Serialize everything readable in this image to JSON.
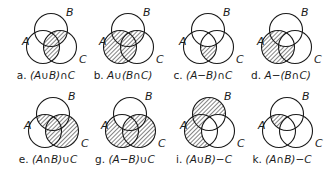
{
  "figure": {
    "diagrams": [
      {
        "id": "a",
        "letter": "a.",
        "expression": "(A∪B)∩C",
        "regions": [
          "AC",
          "BC",
          "ABC"
        ],
        "labels": {
          "A": "A",
          "B": "B",
          "C": "C"
        }
      },
      {
        "id": "b",
        "letter": "b.",
        "expression": "A∪(B∩C)",
        "regions": [
          "A",
          "AB",
          "AC",
          "ABC",
          "BC"
        ],
        "labels": {
          "A": "A",
          "B": "B",
          "C": "C"
        }
      },
      {
        "id": "c",
        "letter": "c.",
        "expression": "(A−B)∩C",
        "regions": [
          "AC"
        ],
        "labels": {
          "A": "A",
          "B": "B",
          "C": "C"
        }
      },
      {
        "id": "d",
        "letter": "d.",
        "expression": "A−(B∩C)",
        "regions": [
          "A",
          "AB",
          "AC"
        ],
        "labels": {
          "A": "A",
          "B": "B",
          "C": "C"
        }
      },
      {
        "id": "e",
        "letter": "e.",
        "expression": "(A∩B)∪C",
        "regions": [
          "AB",
          "ABC",
          "C",
          "AC",
          "BC"
        ],
        "labels": {
          "A": "A",
          "B": "B",
          "C": "C"
        }
      },
      {
        "id": "g",
        "letter": "g.",
        "expression": "(A−B)∪C",
        "regions": [
          "A",
          "AC",
          "C",
          "BC",
          "ABC"
        ],
        "labels": {
          "A": "A",
          "B": "B",
          "C": "C"
        }
      },
      {
        "id": "i",
        "letter": "i.",
        "expression": "(A∪B)−C",
        "regions": [
          "A",
          "B",
          "AB"
        ],
        "labels": {
          "A": "A",
          "B": "B",
          "C": "C"
        }
      },
      {
        "id": "k",
        "letter": "k.",
        "expression": "(A∩B)−C",
        "regions": [
          "AB"
        ],
        "labels": {
          "A": "A",
          "B": "B",
          "C": "C"
        }
      }
    ],
    "colors": {
      "stroke": "#1a1a1a",
      "hatch": "#1a1a1a",
      "background": "#ffffff"
    }
  }
}
